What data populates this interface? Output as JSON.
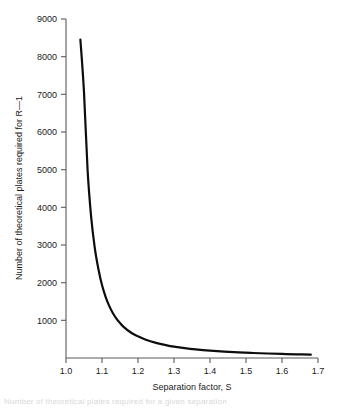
{
  "figure": {
    "background_color": "#ffffff",
    "axis_color": "#5a5a5a",
    "curve_color": "#0d0d0d",
    "text_color": "#1a1a1a",
    "caption_fragment": "Number of theoretical plates required for a given separation"
  },
  "chart_data": {
    "type": "line",
    "title": "",
    "subtitle": "",
    "xlabel": "Separation factor, S",
    "ylabel": "Number of theoretical plates required for R—1",
    "xlim": [
      1.0,
      1.7
    ],
    "ylim": [
      0,
      9000
    ],
    "grid": false,
    "legend": false,
    "legend_position": "none",
    "xticks": [
      1.0,
      1.1,
      1.2,
      1.3,
      1.4,
      1.5,
      1.6,
      1.7
    ],
    "xtick_labels": [
      "1.0",
      "1.1",
      "1.2",
      "1.3",
      "1.4",
      "1.5",
      "1.6",
      "1.7"
    ],
    "yticks": [
      1000,
      2000,
      3000,
      4000,
      5000,
      6000,
      7000,
      8000,
      9000
    ],
    "ytick_labels": [
      "1000",
      "2000",
      "3000",
      "4000",
      "5000",
      "6000",
      "7000",
      "8000",
      "9000"
    ],
    "tick_direction": "out",
    "series": [
      {
        "name": "N = 16 (S/(S-1))^2  for R = 1",
        "color": "#0d0d0d",
        "line_width": 2.2,
        "x": [
          1.04,
          1.05,
          1.06,
          1.07,
          1.08,
          1.09,
          1.1,
          1.11,
          1.12,
          1.13,
          1.14,
          1.15,
          1.16,
          1.18,
          1.2,
          1.22,
          1.25,
          1.28,
          1.3,
          1.33,
          1.36,
          1.4,
          1.44,
          1.48,
          1.52,
          1.56,
          1.6,
          1.64,
          1.68
        ],
        "y": [
          8450,
          7056,
          4984,
          3731,
          2916,
          2364,
          1936,
          1623,
          1383,
          1196,
          1047,
          928,
          828,
          677,
          576,
          490,
          400,
          336,
          302,
          262,
          230,
          196,
          170,
          149,
          133,
          119,
          108,
          98,
          90
        ]
      }
    ],
    "annotations": []
  }
}
